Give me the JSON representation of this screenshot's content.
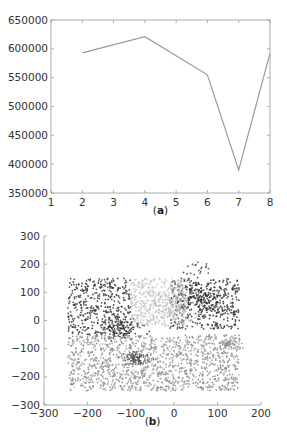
{
  "chart_data": [
    {
      "id": "a",
      "type": "line",
      "caption_open": "(",
      "caption_letter": "a",
      "caption_close": ")",
      "title": "",
      "xlabel": "",
      "ylabel": "",
      "x": [
        2,
        4,
        6,
        7,
        8
      ],
      "series": [
        {
          "name": "",
          "values": [
            593000,
            621000,
            555000,
            390000,
            592000
          ],
          "color": "#9a9a9a"
        }
      ],
      "xlim": [
        1,
        8
      ],
      "ylim": [
        350000,
        650000
      ],
      "xticks": [
        "1",
        "2",
        "3",
        "4",
        "5",
        "6",
        "7",
        "8"
      ],
      "yticks": [
        "350000",
        "400000",
        "450000",
        "500000",
        "550000",
        "600000",
        "650000"
      ],
      "grid": false,
      "legend": "none"
    },
    {
      "id": "b",
      "type": "scatter",
      "caption_open": "(",
      "caption_letter": "b",
      "caption_close": ")",
      "title": "",
      "xlabel": "",
      "ylabel": "",
      "xlim": [
        -300,
        200
      ],
      "ylim": [
        -300,
        300
      ],
      "xticks": [
        "-300",
        "-200",
        "-100",
        "0",
        "100",
        "200"
      ],
      "yticks": [
        "-300",
        "-200",
        "-100",
        "0",
        "100",
        "200",
        "300"
      ],
      "grid": false,
      "legend": "none",
      "series": [
        {
          "name": "cluster-top-left",
          "color": "#3a3a3a",
          "region": {
            "x": [
              -245,
              -100
            ],
            "y": [
              -50,
              150
            ]
          },
          "count": 420
        },
        {
          "name": "cluster-top-right",
          "color": "#3a3a3a",
          "region": {
            "x": [
              -10,
              150
            ],
            "y": [
              -30,
              150
            ]
          },
          "count": 380
        },
        {
          "name": "cluster-top-right-dense",
          "color": "#2a2a2a",
          "center": [
            60,
            75
          ],
          "spread": [
            30,
            25
          ],
          "count": 160
        },
        {
          "name": "cluster-top-left-dense",
          "color": "#2a2a2a",
          "center": [
            -120,
            -30
          ],
          "spread": [
            25,
            18
          ],
          "count": 90
        },
        {
          "name": "cluster-top-right-sparse",
          "color": "#444444",
          "region": {
            "x": [
              20,
              80
            ],
            "y": [
              150,
              215
            ]
          },
          "count": 20
        },
        {
          "name": "cluster-center-light",
          "color": "#c8c8c8",
          "region": {
            "x": [
              -100,
              30
            ],
            "y": [
              -20,
              150
            ]
          },
          "count": 420
        },
        {
          "name": "cluster-center-blob",
          "color": "#bdbdbd",
          "center": [
            0,
            50
          ],
          "spread": [
            35,
            30
          ],
          "count": 150
        },
        {
          "name": "cluster-bottom",
          "color": "#8a8a8a",
          "region": {
            "x": [
              -245,
              150
            ],
            "y": [
              -250,
              -50
            ]
          },
          "count": 900
        },
        {
          "name": "cluster-bottom-dense-left",
          "color": "#555555",
          "center": [
            -90,
            -135
          ],
          "spread": [
            15,
            12
          ],
          "count": 90
        },
        {
          "name": "cluster-bottom-dense-right",
          "color": "#8f8f8f",
          "center": [
            130,
            -80
          ],
          "spread": [
            14,
            10
          ],
          "count": 60
        },
        {
          "name": "cluster-bottom-light",
          "color": "#b0b0b0",
          "region": {
            "x": [
              -240,
              150
            ],
            "y": [
              -250,
              -60
            ]
          },
          "count": 380
        }
      ]
    }
  ]
}
